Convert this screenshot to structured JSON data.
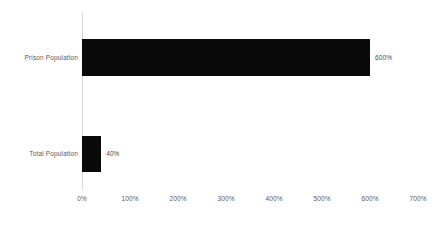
{
  "chart_data": {
    "type": "bar",
    "orientation": "horizontal",
    "title": "",
    "subtitle": "",
    "xlabel": "",
    "ylabel": "",
    "categories": [
      "Prison Population",
      "Total Population"
    ],
    "values": [
      600,
      40
    ],
    "value_labels": [
      "600%",
      "40%"
    ],
    "unit": "%",
    "xlim": [
      0,
      700
    ],
    "xticks": [
      0,
      100,
      200,
      300,
      400,
      500,
      600,
      700
    ],
    "xtick_labels": [
      "0%",
      "100%",
      "200%",
      "300%",
      "400%",
      "500%",
      "600%",
      "700%"
    ],
    "grid": false,
    "legend": null,
    "legend_position": "none",
    "series": [
      {
        "name": "",
        "values": [
          600,
          40
        ],
        "color": "#0a0a0a"
      }
    ],
    "colors": {
      "bar": "#0a0a0a",
      "axis_line": "#d9d9d9",
      "tick_text": "#5a5a5a",
      "category_text": "#5a5a5a",
      "value_text": "#4a4a4a",
      "background": "#ffffff"
    }
  }
}
